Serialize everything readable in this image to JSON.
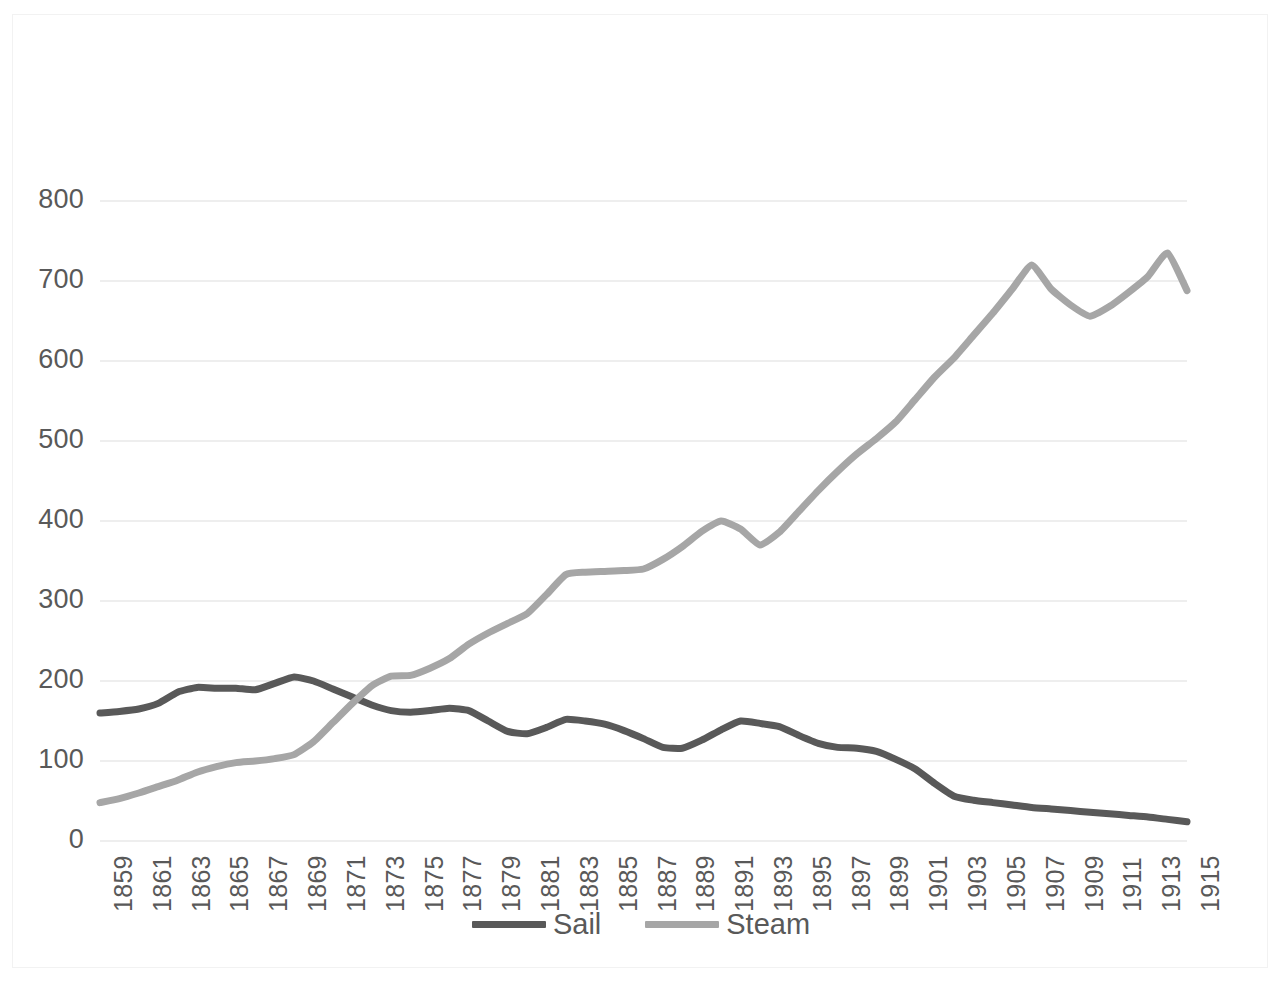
{
  "chart_data": {
    "type": "line",
    "title": "",
    "subtitle": "",
    "xlabel": "",
    "ylabel": "",
    "xlim": [
      1859,
      1915
    ],
    "ylim": [
      0,
      800
    ],
    "grid": "horizontal",
    "legend_position": "bottom",
    "y_ticks": [
      "800",
      "700",
      "600",
      "500",
      "400",
      "300",
      "200",
      "100",
      "0"
    ],
    "y_tick_values": [
      800,
      700,
      600,
      500,
      400,
      300,
      200,
      100,
      0
    ],
    "x_tick_labels": [
      "1859",
      "1861",
      "1863",
      "1865",
      "1867",
      "1869",
      "1871",
      "1873",
      "1875",
      "1877",
      "1879",
      "1881",
      "1883",
      "1885",
      "1887",
      "1889",
      "1891",
      "1893",
      "1895",
      "1897",
      "1899",
      "1901",
      "1903",
      "1905",
      "1907",
      "1909",
      "1911",
      "1913",
      "1915"
    ],
    "x": [
      1859,
      1860,
      1861,
      1862,
      1863,
      1864,
      1865,
      1866,
      1867,
      1868,
      1869,
      1870,
      1871,
      1872,
      1873,
      1874,
      1875,
      1876,
      1877,
      1878,
      1879,
      1880,
      1881,
      1882,
      1883,
      1884,
      1885,
      1886,
      1887,
      1888,
      1889,
      1890,
      1891,
      1892,
      1893,
      1894,
      1895,
      1896,
      1897,
      1898,
      1899,
      1900,
      1901,
      1902,
      1903,
      1904,
      1905,
      1906,
      1907,
      1908,
      1909,
      1910,
      1911,
      1912,
      1913,
      1914,
      1915
    ],
    "series": [
      {
        "name": "Sail",
        "color": "#595959",
        "values": [
          160,
          162,
          165,
          172,
          186,
          192,
          191,
          191,
          189,
          197,
          205,
          200,
          190,
          180,
          170,
          163,
          161,
          163,
          166,
          163,
          150,
          137,
          134,
          142,
          152,
          150,
          146,
          138,
          128,
          117,
          116,
          126,
          139,
          150,
          147,
          143,
          132,
          122,
          117,
          116,
          112,
          102,
          90,
          72,
          56,
          51,
          48,
          45,
          42,
          40,
          38,
          36,
          34,
          32,
          30,
          27,
          24
        ]
      },
      {
        "name": "Steam",
        "color": "#a6a6a6",
        "values": [
          48,
          53,
          60,
          68,
          76,
          86,
          93,
          98,
          100,
          103,
          108,
          124,
          148,
          172,
          194,
          206,
          207,
          216,
          228,
          246,
          260,
          272,
          284,
          308,
          333,
          336,
          337,
          338,
          340,
          352,
          368,
          387,
          400,
          390,
          370,
          386,
          412,
          438,
          462,
          484,
          503,
          524,
          552,
          580,
          604,
          632,
          660,
          690,
          720,
          690,
          670,
          656,
          668,
          686,
          706,
          735,
          688
        ]
      }
    ]
  },
  "legend": {
    "items": [
      {
        "label": "Sail",
        "color": "#595959"
      },
      {
        "label": "Steam",
        "color": "#a6a6a6"
      }
    ]
  },
  "axis": {
    "gridline_color": "#e8e8e8",
    "tick_text_color": "#595959"
  }
}
